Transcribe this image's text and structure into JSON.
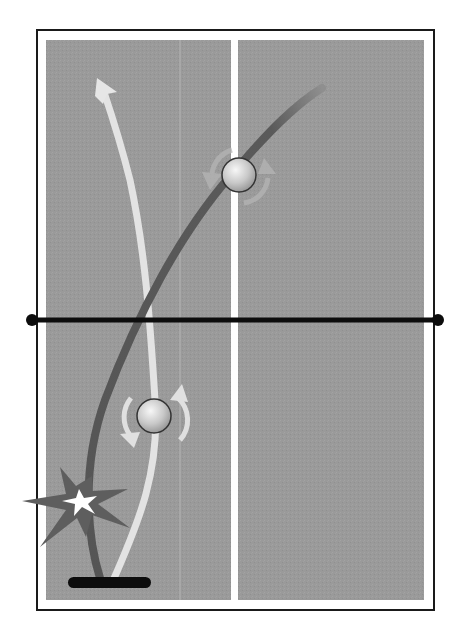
{
  "diagram": {
    "title": "",
    "colors": {
      "background": "#ffffff",
      "table_surface": "#9a9a9a",
      "table_border": "#1a1a1a",
      "center_line": "#ffffff",
      "net": "#0d0d0d",
      "path_light": "#e6e6e6",
      "path_dark": "#5a5a5a",
      "ball": "#d9d9d9",
      "spin_arrow": "#bdbdbd",
      "burst_outer": "#5e5e5e",
      "burst_inner": "#ffffff",
      "paddle": "#0d0d0d"
    },
    "elements": {
      "table": {
        "label": "table-surface"
      },
      "net": {
        "label": "net"
      },
      "center_line": {
        "label": "center-line"
      },
      "light_trajectory": {
        "label": "light-ball-trajectory",
        "has_arrowhead": true
      },
      "dark_trajectory": {
        "label": "dark-ball-trajectory",
        "has_arrowhead": false
      },
      "ball_upper": {
        "label": "ball-far-side",
        "spin": "clockwise"
      },
      "ball_lower": {
        "label": "ball-near-side",
        "spin": "clockwise"
      },
      "impact_burst": {
        "label": "impact-burst"
      },
      "paddle": {
        "label": "paddle"
      }
    }
  }
}
